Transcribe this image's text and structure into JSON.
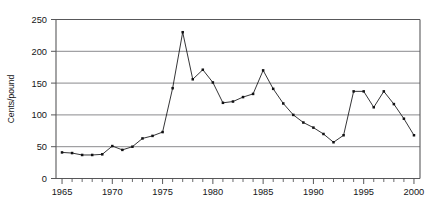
{
  "chart_data": {
    "type": "line",
    "title": "",
    "xlabel": "",
    "ylabel": "Cents/pound",
    "xlim": [
      1964.4,
      2000.6
    ],
    "ylim": [
      0,
      250
    ],
    "grid": true,
    "legend": false,
    "legend_position": "none",
    "y_ticks": [
      0,
      50,
      100,
      150,
      200,
      250
    ],
    "y_tick_labels": [
      "0",
      "50",
      "100",
      "150",
      "200",
      "250"
    ],
    "x_ticks": [
      1965,
      1966,
      1967,
      1968,
      1969,
      1970,
      1971,
      1972,
      1973,
      1974,
      1975,
      1976,
      1977,
      1978,
      1979,
      1980,
      1981,
      1982,
      1983,
      1984,
      1985,
      1986,
      1987,
      1988,
      1989,
      1990,
      1991,
      1992,
      1993,
      1994,
      1995,
      1996,
      1997,
      1998,
      1999,
      2000
    ],
    "x_tick_labels_shown": [
      "1965",
      "1970",
      "1975",
      "1980",
      "1985",
      "1990",
      "1995",
      "2000"
    ],
    "x_labeled_ticks": [
      1965,
      1970,
      1975,
      1980,
      1985,
      1990,
      1995,
      2000
    ],
    "marker": "square",
    "line_color": "#111113",
    "marker_color": "#111113",
    "grid_color": "#7d7d80",
    "axis_color": "#58585a",
    "x": [
      1965,
      1966,
      1967,
      1968,
      1969,
      1970,
      1971,
      1972,
      1973,
      1974,
      1975,
      1976,
      1977,
      1978,
      1979,
      1980,
      1981,
      1982,
      1983,
      1984,
      1985,
      1986,
      1987,
      1988,
      1989,
      1990,
      1991,
      1992,
      1993,
      1994,
      1995,
      1996,
      1997,
      1998,
      1999,
      2000
    ],
    "values": [
      41,
      40,
      37,
      37,
      38,
      51,
      45,
      50,
      63,
      67,
      73,
      142,
      230,
      156,
      171,
      151,
      119,
      121,
      128,
      133,
      170,
      141,
      118,
      100,
      88,
      80,
      70,
      57,
      68,
      137,
      137,
      112,
      137,
      117,
      94,
      68
    ]
  }
}
